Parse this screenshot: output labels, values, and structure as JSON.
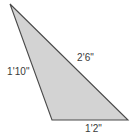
{
  "figure": {
    "kind": "triangle-diagram",
    "background_color": "#ffffff",
    "fill_color": "#d3d3d3",
    "stroke_color": "#4a4a4a",
    "label_color": "#3a3a3a",
    "vertices": {
      "apex_top": [
        10,
        4
      ],
      "bottom_left": [
        52,
        120
      ],
      "bottom_right": [
        128,
        120
      ]
    },
    "labels": {
      "left_side": "1'10\"",
      "hypotenuse": "2'6\"",
      "bottom_side": "1'2\""
    }
  },
  "chart_data": {
    "type": "diagram",
    "title": "",
    "shape": "triangle",
    "sides": [
      {
        "name": "left",
        "label": "1'10\"",
        "feet": 1,
        "inches": 10,
        "total_inches": 22
      },
      {
        "name": "hypotenuse",
        "label": "2'6\"",
        "feet": 2,
        "inches": 6,
        "total_inches": 30
      },
      {
        "name": "bottom",
        "label": "1'2\"",
        "feet": 1,
        "inches": 2,
        "total_inches": 14
      }
    ],
    "units": "feet-inches"
  }
}
